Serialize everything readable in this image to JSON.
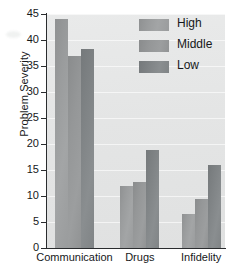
{
  "chart_data": {
    "type": "bar",
    "title": "",
    "subtitle": "",
    "xlabel": "",
    "ylabel": "Problem Severity",
    "categories": [
      "Communication",
      "Drugs",
      "Infidelity"
    ],
    "series": [
      {
        "name": "High",
        "values": [
          44.0,
          12.0,
          6.5
        ],
        "color": "#9a9c9d"
      },
      {
        "name": "Middle",
        "values": [
          37.0,
          12.7,
          9.5
        ],
        "color": "#95979 8"
      },
      {
        "name": "Low",
        "values": [
          38.2,
          18.8,
          16.0
        ],
        "color": "#7f8385"
      }
    ],
    "ylim": [
      0,
      45
    ],
    "yticks": [
      0,
      5,
      10,
      15,
      20,
      25,
      30,
      35,
      40,
      45
    ],
    "ytick_labels": [
      "0",
      "5",
      "10",
      "15",
      "20",
      "25",
      "30",
      "35",
      "40",
      "45"
    ],
    "grid": true,
    "grid_axis": "y",
    "legend_position": "upper-right-inside",
    "legend_entries": [
      "High",
      "Middle",
      "Low"
    ],
    "plot_background": "#e5e6e6",
    "figure_background": "#ffffff",
    "axis_color": "#2a2c2e"
  },
  "axes": {
    "y_title": "Problem Severity"
  },
  "legend": {
    "items": [
      {
        "label": "High"
      },
      {
        "label": "Middle"
      },
      {
        "label": "Low"
      }
    ]
  },
  "x_axis": {
    "ticks": [
      {
        "label": "Communication"
      },
      {
        "label": "Drugs"
      },
      {
        "label": "Infidelity"
      }
    ]
  },
  "y_axis": {
    "ticks": [
      {
        "label": "45"
      },
      {
        "label": "40"
      },
      {
        "label": "35"
      },
      {
        "label": "30"
      },
      {
        "label": "25"
      },
      {
        "label": "20"
      },
      {
        "label": "15"
      },
      {
        "label": "10"
      },
      {
        "label": "5"
      },
      {
        "label": "0"
      }
    ]
  }
}
